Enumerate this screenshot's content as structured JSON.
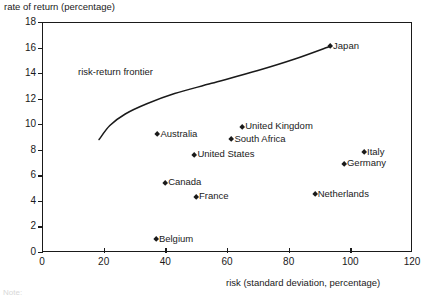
{
  "chart_data": {
    "type": "scatter",
    "title": "",
    "xlabel": "risk (standard deviation, percentage)",
    "ylabel": "rate of return (percentage)",
    "xlim": [
      0,
      120
    ],
    "ylim": [
      0,
      18
    ],
    "xticks": [
      "0",
      "20",
      "40",
      "60",
      "80",
      "100",
      "120"
    ],
    "yticks": [
      "0",
      "2",
      "4",
      "6",
      "8",
      "10",
      "12",
      "14",
      "16",
      "18"
    ],
    "grid": false,
    "legend": "none",
    "annotations": [
      "risk-return frontier"
    ],
    "points": [
      {
        "label": "Japan",
        "x": 93.5,
        "y": 16.1,
        "side": "right"
      },
      {
        "label": "United Kingdom",
        "x": 65.0,
        "y": 9.8,
        "side": "right"
      },
      {
        "label": "South Africa",
        "x": 61.5,
        "y": 8.8,
        "side": "right"
      },
      {
        "label": "Australia",
        "x": 37.5,
        "y": 9.2,
        "side": "right"
      },
      {
        "label": "United States",
        "x": 49.5,
        "y": 7.6,
        "side": "right"
      },
      {
        "label": "Italy",
        "x": 104.5,
        "y": 7.8,
        "side": "right"
      },
      {
        "label": "Germany",
        "x": 98.0,
        "y": 6.9,
        "side": "right"
      },
      {
        "label": "Canada",
        "x": 40.0,
        "y": 5.4,
        "side": "right"
      },
      {
        "label": "Netherlands",
        "x": 88.5,
        "y": 4.5,
        "side": "right"
      },
      {
        "label": "France",
        "x": 50.0,
        "y": 4.3,
        "side": "right"
      },
      {
        "label": "Belgium",
        "x": 37.0,
        "y": 1.0,
        "side": "right"
      }
    ],
    "frontier": {
      "name": "risk-return frontier",
      "points": [
        {
          "x": 18.5,
          "y": 8.8
        },
        {
          "x": 22.0,
          "y": 9.9
        },
        {
          "x": 27.0,
          "y": 10.8
        },
        {
          "x": 34.0,
          "y": 11.6
        },
        {
          "x": 43.0,
          "y": 12.4
        },
        {
          "x": 55.0,
          "y": 13.2
        },
        {
          "x": 70.0,
          "y": 14.2
        },
        {
          "x": 82.0,
          "y": 15.1
        },
        {
          "x": 93.5,
          "y": 16.1
        }
      ]
    }
  },
  "axis_labels": {
    "y_caption": "rate of return (percentage)",
    "x_caption": "risk (standard deviation, percentage)"
  },
  "note": "Note:"
}
